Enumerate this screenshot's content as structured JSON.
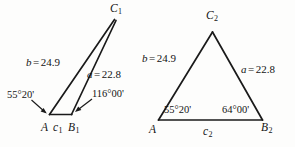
{
  "figure": {
    "caption": "Two triangles illustrating the ambiguous case of the law of sines",
    "triangles": [
      {
        "id": "triangle-1",
        "name": "obtuse-solution",
        "vertices": [
          {
            "name": "A",
            "label": "A",
            "subscript": ""
          },
          {
            "name": "B1",
            "label": "B",
            "subscript": "1"
          },
          {
            "name": "C1",
            "label": "C",
            "subscript": "1"
          }
        ],
        "sides": [
          {
            "name": "side-b",
            "label": "b",
            "equals": "=",
            "value": "24.9"
          },
          {
            "name": "side-a",
            "label": "a",
            "equals": "=",
            "value": "22.8"
          },
          {
            "name": "side-c1",
            "label": "c",
            "subscript": "1",
            "equals": "",
            "value": ""
          }
        ],
        "angles": [
          {
            "name": "angle-A",
            "value": "55°20'"
          },
          {
            "name": "angle-B1",
            "value": "116°00'"
          }
        ]
      },
      {
        "id": "triangle-2",
        "name": "acute-solution",
        "vertices": [
          {
            "name": "A",
            "label": "A",
            "subscript": ""
          },
          {
            "name": "B2",
            "label": "B",
            "subscript": "2"
          },
          {
            "name": "C2",
            "label": "C",
            "subscript": "2"
          }
        ],
        "sides": [
          {
            "name": "side-b",
            "label": "b",
            "equals": "=",
            "value": "24.9"
          },
          {
            "name": "side-a",
            "label": "a",
            "equals": "=",
            "value": "22.8"
          },
          {
            "name": "side-c2",
            "label": "c",
            "subscript": "2",
            "equals": "",
            "value": ""
          }
        ],
        "angles": [
          {
            "name": "angle-A",
            "value": "55°20'"
          },
          {
            "name": "angle-B2",
            "value": "64°00'"
          }
        ]
      }
    ],
    "colors": {
      "stroke": "#1a1a1a",
      "text": "#141414",
      "background": "#fdfdfc"
    }
  }
}
